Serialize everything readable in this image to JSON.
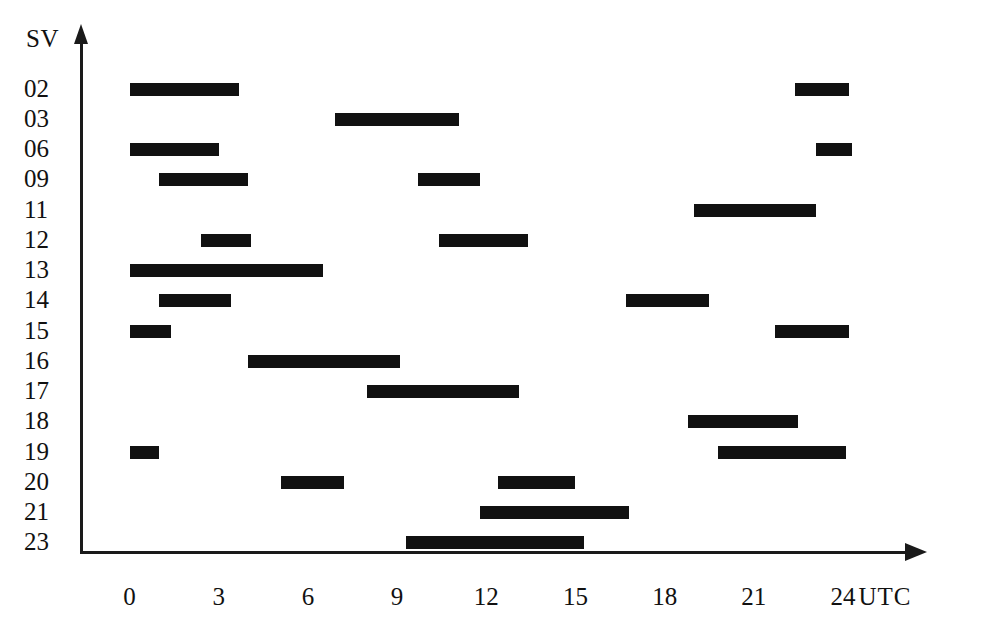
{
  "chart_data": {
    "type": "bar",
    "title": "",
    "subtitle": "",
    "xlabel": "UTC",
    "ylabel": "SV",
    "orientation": "horizontal",
    "style": "gantt-visibility-chart",
    "grid": false,
    "legend": null,
    "xlim": [
      0,
      24
    ],
    "xticks": [
      0,
      3,
      6,
      9,
      12,
      15,
      18,
      21,
      24
    ],
    "xtick_labels": [
      "0",
      "3",
      "6",
      "9",
      "12",
      "15",
      "18",
      "21",
      "24"
    ],
    "x_unit_label": "UTC",
    "categories": [
      "02",
      "03",
      "06",
      "09",
      "11",
      "12",
      "13",
      "14",
      "15",
      "16",
      "17",
      "18",
      "19",
      "20",
      "21",
      "23"
    ],
    "bar_color": "#111111",
    "axis_color": "#1a1a1a",
    "background": "#ffffff",
    "series": [
      {
        "name": "02",
        "intervals": [
          {
            "start": 0.0,
            "end": 3.7
          },
          {
            "start": 22.4,
            "end": 24.2
          }
        ]
      },
      {
        "name": "03",
        "intervals": [
          {
            "start": 6.9,
            "end": 11.1
          }
        ]
      },
      {
        "name": "06",
        "intervals": [
          {
            "start": 0.0,
            "end": 3.0
          },
          {
            "start": 23.1,
            "end": 24.3
          }
        ]
      },
      {
        "name": "09",
        "intervals": [
          {
            "start": 1.0,
            "end": 4.0
          },
          {
            "start": 9.7,
            "end": 11.8
          }
        ]
      },
      {
        "name": "11",
        "intervals": [
          {
            "start": 19.0,
            "end": 23.1
          }
        ]
      },
      {
        "name": "12",
        "intervals": [
          {
            "start": 2.4,
            "end": 4.1
          },
          {
            "start": 10.4,
            "end": 13.4
          }
        ]
      },
      {
        "name": "13",
        "intervals": [
          {
            "start": 0.0,
            "end": 6.5
          }
        ]
      },
      {
        "name": "14",
        "intervals": [
          {
            "start": 1.0,
            "end": 3.4
          },
          {
            "start": 16.7,
            "end": 19.5
          }
        ]
      },
      {
        "name": "15",
        "intervals": [
          {
            "start": 0.0,
            "end": 1.4
          },
          {
            "start": 21.7,
            "end": 24.2
          }
        ]
      },
      {
        "name": "16",
        "intervals": [
          {
            "start": 4.0,
            "end": 9.1
          }
        ]
      },
      {
        "name": "17",
        "intervals": [
          {
            "start": 8.0,
            "end": 13.1
          }
        ]
      },
      {
        "name": "18",
        "intervals": [
          {
            "start": 18.8,
            "end": 22.5
          }
        ]
      },
      {
        "name": "19",
        "intervals": [
          {
            "start": 0.0,
            "end": 1.0
          },
          {
            "start": 19.8,
            "end": 24.1
          }
        ]
      },
      {
        "name": "20",
        "intervals": [
          {
            "start": 5.1,
            "end": 7.2
          },
          {
            "start": 12.4,
            "end": 15.0
          }
        ]
      },
      {
        "name": "21",
        "intervals": [
          {
            "start": 11.8,
            "end": 16.8
          }
        ]
      },
      {
        "name": "23",
        "intervals": [
          {
            "start": 9.3,
            "end": 15.3
          }
        ]
      }
    ]
  },
  "axis": {
    "y_title": "SV",
    "x_unit": "UTC"
  }
}
